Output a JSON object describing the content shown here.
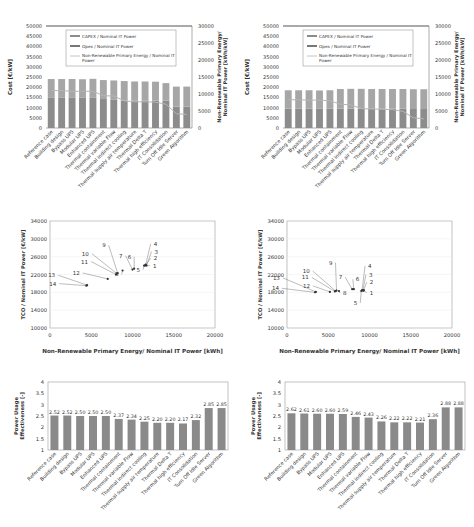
{
  "categories": [
    "Reference case",
    "Building design",
    "Bypass UPS",
    "Modular UPS",
    "Enhanced UPS",
    "Thermal containment",
    "Thermal variable Flow",
    "Thermal indirect cooling",
    "Thermal supply air temperature",
    "Thermal Delta T",
    "Thermal high efficiency",
    "IT Consolidation",
    "Turn Off Idle Server",
    "Green Algorithm"
  ],
  "chart_data": [
    {
      "type": "bar",
      "id": "cost-left",
      "stacked": true,
      "categories_ref": "categories",
      "ylabel": "Cost [€/kW]",
      "y2label": "Non-Renewable Primary Energy/ Nominal IT Power [kWh/kW]",
      "ylim": [
        0,
        50000
      ],
      "y2lim": [
        0,
        30000
      ],
      "yticks": [
        0,
        5000,
        10000,
        15000,
        20000,
        25000,
        30000,
        35000,
        40000,
        45000,
        50000
      ],
      "y2ticks": [
        0,
        5000,
        10000,
        15000,
        20000,
        25000,
        30000
      ],
      "legend": [
        "CAPEX / Nominal IT Power",
        "Opex / Nominal IT Power",
        "Non-Renewable Primary Energy / Nominal IT Power"
      ],
      "series": [
        {
          "name": "CAPEX / Nominal IT Power",
          "axis": "left",
          "values": [
            15000,
            15000,
            15000,
            14800,
            15000,
            14200,
            14000,
            13500,
            13500,
            13500,
            13500,
            13500,
            10500,
            10500
          ]
        },
        {
          "name": "Opex / Nominal IT Power",
          "axis": "left",
          "values": [
            9000,
            9000,
            9000,
            9100,
            9100,
            9300,
            9300,
            9500,
            9300,
            9300,
            9200,
            8500,
            9800,
            9800
          ]
        },
        {
          "name": "Non-Renewable Primary Energy / Nominal IT Power",
          "axis": "right",
          "type": "line",
          "values": [
            11000,
            11000,
            10800,
            10800,
            10800,
            9500,
            9400,
            8000,
            7700,
            7700,
            7600,
            7000,
            4200,
            4000
          ]
        }
      ]
    },
    {
      "type": "bar",
      "id": "cost-right",
      "stacked": true,
      "categories_ref": "categories",
      "ylabel": "Cost [€/kW]",
      "y2label": "Non-Renewable Primary Energy/ Nominal IT Power [kWh/kW]",
      "ylim": [
        0,
        50000
      ],
      "y2lim": [
        0,
        30000
      ],
      "yticks": [
        0,
        5000,
        10000,
        15000,
        20000,
        25000,
        30000,
        35000,
        40000,
        45000,
        50000
      ],
      "y2ticks": [
        0,
        5000,
        10000,
        15000,
        20000,
        25000,
        30000
      ],
      "legend": [
        "CAPEX / Nominal IT Power",
        "Opex / Nominal IT Power",
        "Non-Renewable Primary Energy / Nominal IT Power"
      ],
      "series": [
        {
          "name": "CAPEX / Nominal IT Power",
          "axis": "left",
          "values": [
            9500,
            9500,
            9500,
            9400,
            9500,
            9500,
            9500,
            9500,
            9500,
            9500,
            9500,
            9500,
            9300,
            9300
          ]
        },
        {
          "name": "Opex / Nominal IT Power",
          "axis": "left",
          "values": [
            9000,
            9000,
            9000,
            9000,
            9000,
            9600,
            9700,
            9700,
            9600,
            9600,
            9600,
            9600,
            9700,
            9700
          ]
        },
        {
          "name": "Non-Renewable Primary Energy / Nominal IT Power",
          "axis": "right",
          "type": "line",
          "values": [
            8300,
            8300,
            8200,
            8200,
            8000,
            7000,
            6800,
            5700,
            5600,
            5500,
            5400,
            4900,
            3000,
            2700
          ]
        }
      ]
    },
    {
      "type": "scatter",
      "id": "tco-left",
      "xlabel": "Non-Renewable Primary Energy/ Nominal IT Power [kWh]",
      "ylabel": "TCO / Nominal IT Power [€/kW]",
      "xlim": [
        0,
        20000
      ],
      "ylim": [
        10000,
        34000
      ],
      "xticks": [
        0,
        5000,
        10000,
        15000,
        20000
      ],
      "yticks": [
        10000,
        14000,
        18000,
        22000,
        26000,
        30000,
        34000
      ],
      "points": [
        {
          "label": "1",
          "x": 11500,
          "y": 24000
        },
        {
          "label": "2",
          "x": 11600,
          "y": 24100
        },
        {
          "label": "3",
          "x": 11700,
          "y": 24000
        },
        {
          "label": "4",
          "x": 11600,
          "y": 24200
        },
        {
          "label": "5",
          "x": 11400,
          "y": 24000
        },
        {
          "label": "6",
          "x": 10200,
          "y": 23300
        },
        {
          "label": "7",
          "x": 10000,
          "y": 23100
        },
        {
          "label": "8",
          "x": 8800,
          "y": 22900
        },
        {
          "label": "9",
          "x": 8200,
          "y": 22300
        },
        {
          "label": "10",
          "x": 8100,
          "y": 22200
        },
        {
          "label": "11",
          "x": 8000,
          "y": 22000
        },
        {
          "label": "12",
          "x": 7000,
          "y": 21000
        },
        {
          "label": "13",
          "x": 4500,
          "y": 19600
        },
        {
          "label": "14",
          "x": 4400,
          "y": 19500
        }
      ]
    },
    {
      "type": "scatter",
      "id": "tco-right",
      "xlabel": "Non-Renewable Primary Energy/ Nominal IT Power [kWh]",
      "ylabel": "TCO / Nominal IT Power [€/kW]",
      "xlim": [
        0,
        20000
      ],
      "ylim": [
        10000,
        34000
      ],
      "xticks": [
        0,
        5000,
        10000,
        15000,
        20000
      ],
      "yticks": [
        10000,
        14000,
        18000,
        22000,
        26000,
        30000,
        34000
      ],
      "points": [
        {
          "label": "1",
          "x": 9300,
          "y": 18400
        },
        {
          "label": "2",
          "x": 9300,
          "y": 18500
        },
        {
          "label": "3",
          "x": 9200,
          "y": 18400
        },
        {
          "label": "4",
          "x": 9100,
          "y": 18500
        },
        {
          "label": "5",
          "x": 9000,
          "y": 18300
        },
        {
          "label": "6",
          "x": 8100,
          "y": 18700
        },
        {
          "label": "7",
          "x": 7900,
          "y": 18700
        },
        {
          "label": "8",
          "x": 6300,
          "y": 18300
        },
        {
          "label": "9",
          "x": 6000,
          "y": 18400
        },
        {
          "label": "10",
          "x": 5900,
          "y": 18300
        },
        {
          "label": "11",
          "x": 5800,
          "y": 18200
        },
        {
          "label": "12",
          "x": 5200,
          "y": 18100
        },
        {
          "label": "13",
          "x": 3500,
          "y": 18100
        },
        {
          "label": "14",
          "x": 3400,
          "y": 18000
        }
      ]
    },
    {
      "type": "bar",
      "id": "pue-left",
      "categories_ref": "categories",
      "ylabel": "Power Usage Effectiveness [-]",
      "ylim": [
        1,
        4
      ],
      "yticks": [
        1,
        1.5,
        2,
        2.5,
        3,
        3.5,
        4
      ],
      "values": [
        2.52,
        2.52,
        2.5,
        2.5,
        2.5,
        2.37,
        2.34,
        2.25,
        2.2,
        2.2,
        2.17,
        2.32,
        2.85,
        2.85
      ],
      "data_labels": [
        "2.52",
        "2.52",
        "2.50",
        "2.50",
        "2.50",
        "2.37",
        "2.34",
        "2.25",
        "2.20",
        "2.20",
        "2.17",
        "2.32",
        "2.85",
        "2.85"
      ]
    },
    {
      "type": "bar",
      "id": "pue-right",
      "categories_ref": "categories",
      "ylabel": "Power Usage Effectiveness [-]",
      "ylim": [
        1,
        4
      ],
      "yticks": [
        1,
        1.5,
        2,
        2.5,
        3,
        3.5,
        4
      ],
      "values": [
        2.62,
        2.61,
        2.6,
        2.6,
        2.59,
        2.46,
        2.43,
        2.26,
        2.22,
        2.22,
        2.21,
        2.36,
        2.88,
        2.88
      ],
      "data_labels": [
        "2.62",
        "2.61",
        "2.60",
        "2.60",
        "2.59",
        "2.46",
        "2.43",
        "2.26",
        "2.22",
        "2.22",
        "2.21",
        "2.36",
        "2.88",
        "2.88"
      ]
    }
  ],
  "colors": {
    "capex": "#8c8c8c",
    "opex": "#a6a6a6",
    "line": "#b5b5b5",
    "bar": "#8a8a8a",
    "axis": "#777777",
    "grid": "#e8e8e8",
    "text": "#333333"
  }
}
